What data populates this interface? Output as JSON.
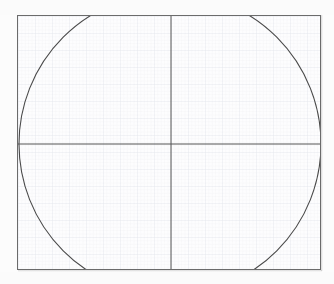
{
  "canvas": {
    "width": 334,
    "height": 284,
    "background_color": "#fcfcfc",
    "title": "Circle inscribed on graph paper with crosshair axes"
  },
  "plot_box": {
    "label": "graph-paper-frame",
    "x": 17,
    "y": 15,
    "width": 304,
    "height": 255,
    "border_color": "#6b6b6b",
    "border_width": 1,
    "fill_color": "#fdfdfe"
  },
  "grid": {
    "visible": true,
    "minor_spacing_px": 3.4,
    "major_spacing_px": 17,
    "minor_color": "#eef0f3",
    "major_color": "#e2e5ea",
    "minor_width": 0.5,
    "major_width": 0.7
  },
  "axes": {
    "visible": true,
    "color": "#555555",
    "width": 1,
    "vertical_x": 171,
    "horizontal_y": 144,
    "vertical_label": "vertical-axis",
    "horizontal_label": "horizontal-axis"
  },
  "chart_data": {
    "type": "scatter",
    "title": "Circle inscribed on graph paper with crosshair axes",
    "xlabel": "",
    "ylabel": "",
    "grid": true,
    "legend": "none",
    "shapes": [
      {
        "kind": "circle",
        "name": "main-circle",
        "center_x": 170,
        "center_y": 144,
        "radius": 151,
        "stroke": "#4a4a4a",
        "stroke_width": 1.1,
        "fill": "none",
        "clipped": true,
        "clip_note": "arc is cut off by the top and bottom edges of the plot frame"
      },
      {
        "kind": "line",
        "name": "vertical-axis",
        "x1": 171,
        "y1": 15,
        "x2": 171,
        "y2": 270,
        "stroke": "#555555",
        "stroke_width": 1
      },
      {
        "kind": "line",
        "name": "horizontal-axis",
        "x1": 17,
        "y1": 144,
        "x2": 321,
        "y2": 144,
        "stroke": "#555555",
        "stroke_width": 1
      }
    ],
    "intersections": [
      {
        "label": "circle-meets-top-border-left",
        "x": 96,
        "y": 15
      },
      {
        "label": "circle-meets-top-border-right",
        "x": 243,
        "y": 15
      },
      {
        "label": "circle-meets-bottom-border-left",
        "x": 90,
        "y": 270
      },
      {
        "label": "circle-meets-bottom-border-right",
        "x": 250,
        "y": 270
      },
      {
        "label": "circle-leftmost-point",
        "x": 19,
        "y": 144
      },
      {
        "label": "circle-rightmost-point",
        "x": 318,
        "y": 144
      },
      {
        "label": "axes-origin",
        "x": 171,
        "y": 144
      }
    ],
    "xlim": [
      17,
      321
    ],
    "ylim": [
      15,
      270
    ]
  }
}
